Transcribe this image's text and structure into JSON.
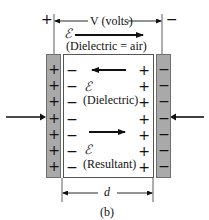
{
  "figure": {
    "caption": "(b)",
    "voltage": {
      "label": "V (volts)",
      "plus": "+",
      "minus": "−"
    },
    "field_air": {
      "symbol": "ℰ",
      "label": "(Dielectric = air)",
      "direction": "right"
    },
    "field_dielectric": {
      "symbol": "ℰ",
      "label": "(Dielectric)",
      "direction": "left"
    },
    "field_resultant": {
      "symbol": "ℰ",
      "label": "(Resultant)",
      "direction": "right"
    },
    "distance": {
      "label": "d"
    },
    "left_plate": {
      "sign": "+",
      "count": 7
    },
    "right_plate": {
      "sign": "−",
      "count": 7
    },
    "dielectric_left_charge": "−",
    "dielectric_right_charge": "+",
    "colors": {
      "plate": "#a9a9a9",
      "line": "#111111"
    }
  }
}
